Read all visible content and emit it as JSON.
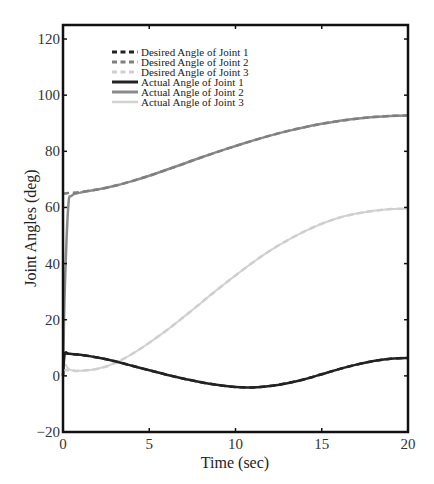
{
  "chart_data": {
    "type": "line",
    "title": "",
    "xlabel": "Time (sec)",
    "ylabel": "Joint Angles (deg)",
    "xlim": [
      0,
      20
    ],
    "ylim": [
      -20,
      125
    ],
    "xticks": [
      0,
      5,
      10,
      15,
      20
    ],
    "yticks": [
      -20,
      0,
      20,
      40,
      60,
      80,
      100,
      120
    ],
    "grid": false,
    "legend_position": "upper left",
    "x": [
      0,
      0.1,
      0.3,
      0.5,
      1,
      2,
      3,
      4,
      5,
      6,
      7,
      8,
      9,
      10,
      11,
      12,
      13,
      14,
      15,
      16,
      17,
      18,
      19,
      20
    ],
    "series": [
      {
        "name": "Desired Angle of Joint 1",
        "color": "#222222",
        "style": "dashed",
        "width": 2.5,
        "values": [
          8,
          8,
          7.9,
          7.8,
          7.5,
          6.5,
          5.2,
          3.6,
          2.0,
          0.4,
          -1.0,
          -2.3,
          -3.3,
          -4.0,
          -4.1,
          -3.6,
          -2.6,
          -1.2,
          0.6,
          2.4,
          4.0,
          5.3,
          6.1,
          6.4
        ]
      },
      {
        "name": "Desired Angle of Joint 2",
        "color": "#7f7f7f",
        "style": "dashed",
        "width": 2.5,
        "values": [
          65,
          65,
          65.1,
          65.2,
          65.5,
          66.4,
          67.7,
          69.4,
          71.3,
          73.4,
          75.6,
          77.8,
          79.9,
          81.9,
          83.8,
          85.6,
          87.2,
          88.6,
          89.8,
          90.8,
          91.6,
          92.2,
          92.6,
          92.8
        ]
      },
      {
        "name": "Desired Angle of Joint 3",
        "color": "#cfcfcf",
        "style": "dashed",
        "width": 2.5,
        "values": [
          2,
          2,
          2,
          1.9,
          1.8,
          2.5,
          4.5,
          7.8,
          11.8,
          16.2,
          21.0,
          26.0,
          31.0,
          35.8,
          40.4,
          44.6,
          48.3,
          51.5,
          54.2,
          56.3,
          57.8,
          58.8,
          59.4,
          59.6
        ]
      },
      {
        "name": "Actual Angle of Joint 1",
        "color": "#222222",
        "style": "solid",
        "width": 2.5,
        "values": [
          0,
          7.8,
          7.9,
          7.8,
          7.5,
          6.5,
          5.2,
          3.6,
          2.0,
          0.4,
          -1.0,
          -2.3,
          -3.3,
          -4.0,
          -4.1,
          -3.6,
          -2.6,
          -1.2,
          0.6,
          2.4,
          4.0,
          5.3,
          6.1,
          6.4
        ]
      },
      {
        "name": "Actual Angle of Joint 2",
        "color": "#8a8a8a",
        "style": "solid",
        "width": 2.5,
        "values": [
          0,
          30,
          60,
          64.2,
          65.3,
          66.4,
          67.7,
          69.4,
          71.3,
          73.4,
          75.6,
          77.8,
          79.9,
          81.9,
          83.8,
          85.6,
          87.2,
          88.6,
          89.8,
          90.8,
          91.6,
          92.2,
          92.6,
          92.8
        ]
      },
      {
        "name": "Actual Angle of Joint 3",
        "color": "#d2d2d2",
        "style": "solid",
        "width": 2,
        "values": [
          0,
          4,
          2.6,
          2.0,
          1.8,
          2.5,
          4.5,
          7.8,
          11.8,
          16.2,
          21.0,
          26.0,
          31.0,
          35.8,
          40.4,
          44.6,
          48.3,
          51.5,
          54.2,
          56.3,
          57.8,
          58.8,
          59.4,
          59.6
        ]
      }
    ]
  }
}
